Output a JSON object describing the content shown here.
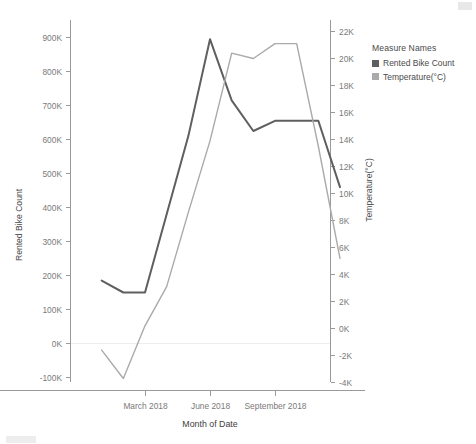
{
  "legend": {
    "title": "Measure Names",
    "items": [
      {
        "label": "Rented Bike Count",
        "color": "#5f5f5f"
      },
      {
        "label": "Temperature(°C)",
        "color": "#aaaaaa"
      }
    ]
  },
  "axes": {
    "left": {
      "title": "Rented Bike Count",
      "ticks": [
        "900K",
        "800K",
        "700K",
        "600K",
        "500K",
        "400K",
        "300K",
        "200K",
        "100K",
        "0K",
        "-100K"
      ],
      "min": -100000,
      "max": 900000
    },
    "right": {
      "title": "Temperature(°C)",
      "ticks": [
        "22K",
        "20K",
        "18K",
        "16K",
        "14K",
        "12K",
        "10K",
        "8K",
        "6K",
        "4K",
        "2K",
        "0K",
        "-2K",
        "-4K"
      ],
      "min": -4000,
      "max": 22000
    },
    "bottom": {
      "title": "Month of Date",
      "ticks": [
        "March 2018",
        "June 2018",
        "September 2018"
      ]
    }
  },
  "chart_data": {
    "type": "line",
    "title": "",
    "xlabel": "Month of Date",
    "ylabel": "Rented Bike Count",
    "y2label": "Temperature(°C)",
    "grid": false,
    "legend_position": "right",
    "x": [
      "January 2018",
      "February 2018",
      "March 2018",
      "April 2018",
      "May 2018",
      "June 2018",
      "July 2018",
      "August 2018",
      "September 2018",
      "October 2018",
      "November 2018",
      "December 2018"
    ],
    "xtick_labels": [
      "March 2018",
      "June 2018",
      "September 2018"
    ],
    "ylim": [
      -100000,
      900000
    ],
    "y2lim": [
      -4000,
      22000
    ],
    "series": [
      {
        "name": "Rented Bike Count",
        "axis": "left",
        "color": "#5f5f5f",
        "values": [
          185000,
          150000,
          150000,
          380000,
          610000,
          895000,
          715000,
          625000,
          655000,
          655000,
          655000,
          460000
        ]
      },
      {
        "name": "Temperature(°C)",
        "axis": "right",
        "color": "#aaaaaa",
        "values": [
          -1600,
          -3700,
          200,
          3100,
          8600,
          13900,
          20400,
          20000,
          21100,
          21100,
          13500,
          5200
        ]
      }
    ]
  }
}
